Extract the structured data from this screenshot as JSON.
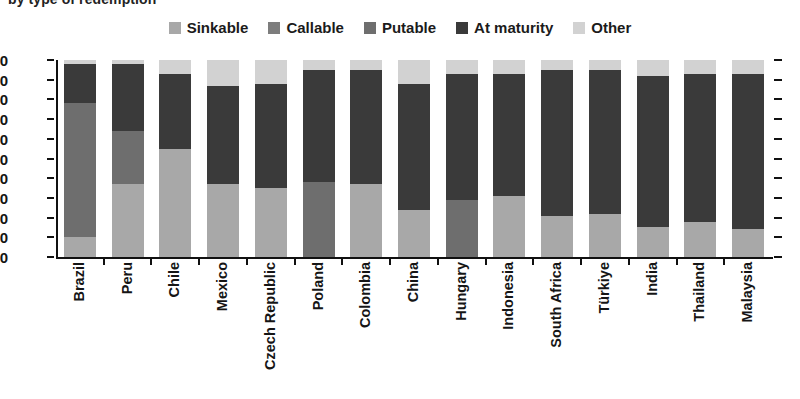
{
  "title": "by type of redemption",
  "legend": {
    "items": [
      {
        "label": "Sinkable",
        "color": "#a8a8a8"
      },
      {
        "label": "Callable",
        "color": "#7d7d7d"
      },
      {
        "label": "Putable",
        "color": "#6e6e6e"
      },
      {
        "label": "At maturity",
        "color": "#3a3a3a"
      },
      {
        "label": "Other",
        "color": "#d2d2d2"
      }
    ]
  },
  "chart_data": {
    "type": "bar",
    "title": "by type of redemption",
    "xlabel": "",
    "ylabel": "",
    "ylim": [
      0,
      100
    ],
    "yticks": [
      0,
      10,
      20,
      30,
      40,
      50,
      60,
      70,
      80,
      90,
      100
    ],
    "grid": false,
    "stacked": true,
    "legend_position": "top-center",
    "categories": [
      "Brazil",
      "Peru",
      "Chile",
      "Mexico",
      "Czech Republic",
      "Poland",
      "Colombia",
      "China",
      "Hungary",
      "Indonesia",
      "South Africa",
      "Türkiye",
      "India",
      "Thailand",
      "Malaysia"
    ],
    "series": [
      {
        "name": "Sinkable",
        "color": "#a8a8a8",
        "values": [
          10,
          37,
          55,
          37,
          35,
          0,
          37,
          24,
          0,
          31,
          21,
          22,
          15,
          18,
          14
        ]
      },
      {
        "name": "Callable",
        "color": "#7d7d7d",
        "values": [
          0,
          0,
          0,
          0,
          0,
          0,
          0,
          0,
          0,
          0,
          0,
          0,
          0,
          0,
          0
        ]
      },
      {
        "name": "Putable",
        "color": "#6e6e6e",
        "values": [
          68,
          27,
          0,
          0,
          0,
          38,
          0,
          0,
          29,
          0,
          0,
          0,
          0,
          0,
          0
        ]
      },
      {
        "name": "At maturity",
        "color": "#3a3a3a",
        "values": [
          20,
          34,
          38,
          50,
          53,
          57,
          58,
          64,
          64,
          62,
          74,
          73,
          77,
          75,
          79
        ]
      },
      {
        "name": "Other",
        "color": "#d2d2d2",
        "values": [
          2,
          2,
          7,
          13,
          12,
          5,
          5,
          12,
          7,
          7,
          5,
          5,
          8,
          7,
          7
        ]
      }
    ]
  }
}
